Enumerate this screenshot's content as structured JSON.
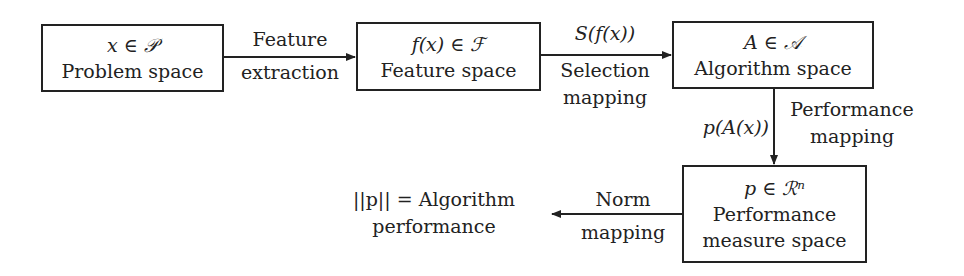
{
  "diagram": {
    "nodes": [
      {
        "id": "problem",
        "math": "x ∈ 𝒫",
        "label": "Problem space"
      },
      {
        "id": "feature",
        "math": "f(x) ∈ ℱ",
        "label": "Feature space"
      },
      {
        "id": "algorithm",
        "math": "A ∈ 𝒜",
        "label": "Algorithm space"
      },
      {
        "id": "performance",
        "math": "p ∈ ℛⁿ",
        "label_line1": "Performance",
        "label_line2": "measure space"
      }
    ],
    "edges": [
      {
        "from": "problem",
        "to": "feature",
        "label_line1": "Feature",
        "label_line2": "extraction"
      },
      {
        "from": "feature",
        "to": "algorithm",
        "math": "S(f(x))",
        "label_line1": "Selection",
        "label_line2": "mapping"
      },
      {
        "from": "algorithm",
        "to": "performance",
        "math": "p(A(x))",
        "label_line1": "Performance",
        "label_line2": "mapping"
      },
      {
        "from": "performance",
        "to": "result",
        "label_line1": "Norm",
        "label_line2": "mapping"
      }
    ],
    "result": {
      "line1": "||p|| = Algorithm",
      "line2": "performance"
    }
  }
}
